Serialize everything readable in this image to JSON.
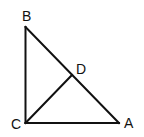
{
  "diagram": {
    "type": "geometry",
    "stroke_color": "#111111",
    "points": {
      "A": {
        "label": "A",
        "x": 119,
        "y": 123
      },
      "B": {
        "label": "B",
        "x": 25.5,
        "y": 27
      },
      "C": {
        "label": "C",
        "x": 25.5,
        "y": 123
      },
      "D": {
        "label": "D",
        "x": 72,
        "y": 75
      }
    },
    "segments": [
      {
        "from": "B",
        "to": "C"
      },
      {
        "from": "C",
        "to": "A"
      },
      {
        "from": "B",
        "to": "A"
      },
      {
        "from": "C",
        "to": "D"
      }
    ],
    "labels": {
      "A": "A",
      "B": "B",
      "C": "C",
      "D": "D"
    }
  }
}
